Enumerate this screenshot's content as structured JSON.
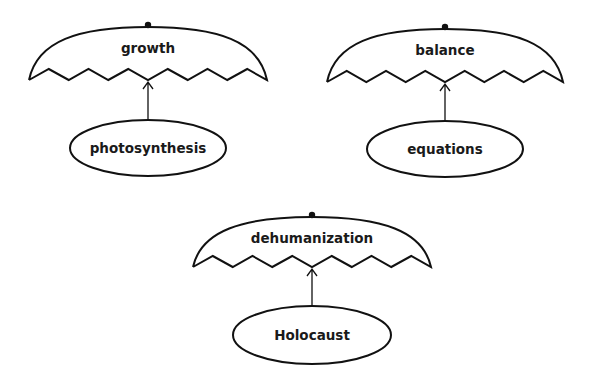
{
  "diagram": {
    "type": "umbrella-concept-map",
    "colors": {
      "stroke": "#111111",
      "text": "#1a1a1a",
      "background": "#ffffff"
    },
    "umbrellas": [
      {
        "concept": "growth",
        "example": "photosynthesis",
        "geometry": {
          "cx": 148,
          "top": 27,
          "tip_y": 80,
          "half_width": 119,
          "peak_y": 69,
          "ellipse_cy": 148,
          "ellipse_rx": 78,
          "ellipse_ry": 28
        }
      },
      {
        "concept": "balance",
        "example": "equations",
        "geometry": {
          "cx": 445,
          "top": 29,
          "tip_y": 82,
          "half_width": 118,
          "peak_y": 71,
          "ellipse_cy": 149,
          "ellipse_rx": 78,
          "ellipse_ry": 28
        }
      },
      {
        "concept": "dehumanization",
        "example": "Holocaust",
        "geometry": {
          "cx": 312,
          "top": 217,
          "tip_y": 267,
          "half_width": 119,
          "peak_y": 256,
          "ellipse_cy": 335,
          "ellipse_rx": 79,
          "ellipse_ry": 29
        }
      }
    ]
  }
}
